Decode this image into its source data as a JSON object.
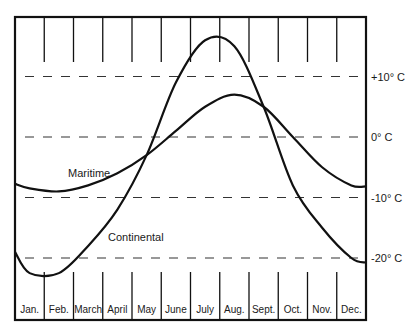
{
  "chart_data": {
    "type": "line",
    "title": "",
    "xlabel": "",
    "ylabel": "",
    "categories": [
      "Jan.",
      "Feb.",
      "March",
      "April",
      "May",
      "June",
      "July",
      "Aug.",
      "Sept.",
      "Oct.",
      "Nov.",
      "Dec."
    ],
    "y_ticks": [
      {
        "value": 10,
        "label": "+10° C"
      },
      {
        "value": 0,
        "label": "0° C"
      },
      {
        "value": -10,
        "label": "-10° C"
      },
      {
        "value": -20,
        "label": "-20° C"
      }
    ],
    "ylim": [
      -25,
      25
    ],
    "grid": "dashed horizontal at 10° intervals",
    "series": [
      {
        "name": "Maritime",
        "label": "Maritime",
        "values": [
          -8.5,
          -9,
          -8,
          -6,
          -3,
          1,
          5,
          7,
          5,
          0,
          -5,
          -8
        ]
      },
      {
        "name": "Continental",
        "label": "Continental",
        "values": [
          -22.5,
          -22.5,
          -18,
          -12,
          -3,
          9,
          16,
          15,
          5,
          -8,
          -15,
          -20
        ]
      }
    ],
    "legend": "inline labels on curves"
  }
}
